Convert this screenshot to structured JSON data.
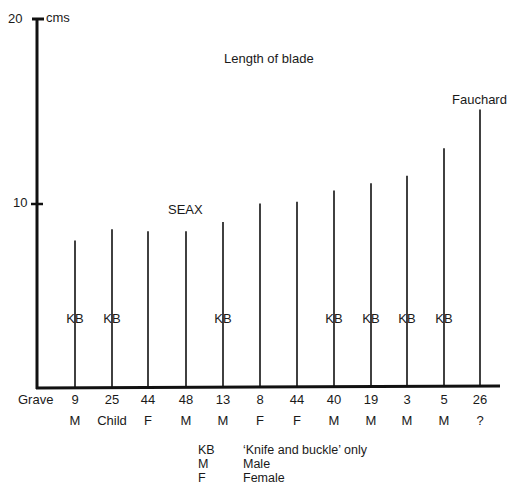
{
  "chart_data": {
    "type": "bar",
    "title": "Length of blade",
    "ylabel": "cms",
    "xlabel": "Grave",
    "ylim": [
      0,
      20
    ],
    "yticks": [
      10,
      20
    ],
    "grid": false,
    "categories": [
      "9",
      "25",
      "44",
      "48",
      "13",
      "8",
      "44",
      "40",
      "19",
      "3",
      "5",
      "26"
    ],
    "sex": [
      "M",
      "Child",
      "F",
      "M",
      "M",
      "F",
      "F",
      "M",
      "M",
      "M",
      "M",
      "?"
    ],
    "values": [
      8.0,
      8.6,
      8.5,
      8.5,
      9.0,
      10.0,
      10.1,
      10.7,
      11.1,
      11.5,
      13.0,
      15.1
    ],
    "kb_flags": [
      true,
      true,
      false,
      false,
      true,
      false,
      false,
      true,
      true,
      true,
      true,
      false
    ],
    "annotations": [
      {
        "text": "SEAX",
        "near_category_index": 3
      },
      {
        "text": "Fauchard",
        "near_category_index": 11
      }
    ],
    "legend": [
      {
        "key": "KB",
        "label": "‘Knife and buckle’ only"
      },
      {
        "key": "M",
        "label": "Male"
      },
      {
        "key": "F",
        "label": "Female"
      }
    ]
  },
  "axis": {
    "y_top_label": "20",
    "y_mid_label": "10",
    "unit_label": "cms",
    "x_row_label": "Grave"
  },
  "labels": {
    "title": "Length of blade",
    "seax": "SEAX",
    "fauchard": "Fauchard",
    "kb": "KB"
  },
  "colors": {
    "ink": "#111111",
    "text": "#222222",
    "background": "#ffffff"
  }
}
